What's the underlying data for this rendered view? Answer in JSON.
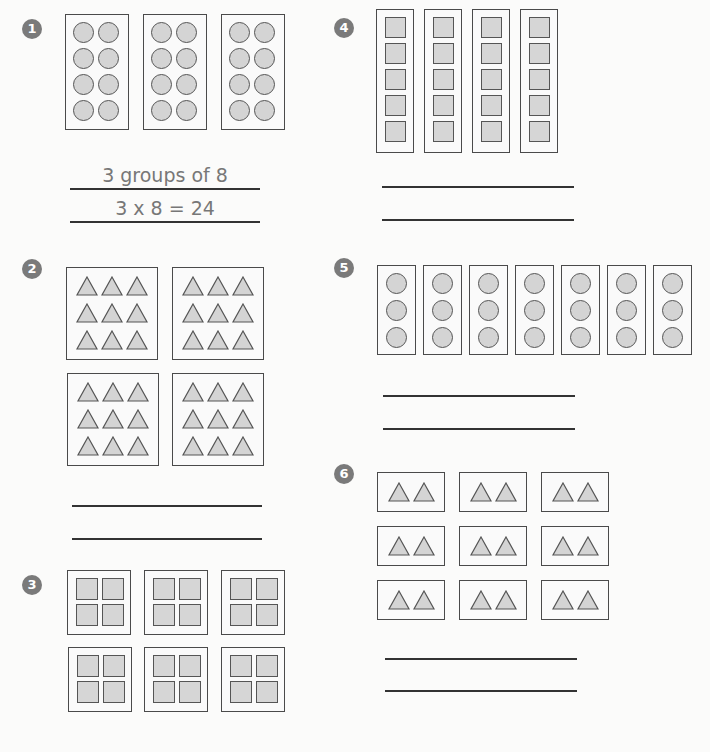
{
  "worksheet": {
    "problems": [
      {
        "number": "1",
        "groups": 3,
        "items_per_group": 8,
        "shape": "circle",
        "answer_line_1": "3 groups of 8",
        "answer_line_2": "3 x 8 = 24"
      },
      {
        "number": "2",
        "groups": 4,
        "items_per_group": 9,
        "shape": "triangle",
        "answer_line_1": "",
        "answer_line_2": ""
      },
      {
        "number": "3",
        "groups": 6,
        "items_per_group": 4,
        "shape": "square",
        "answer_line_1": "",
        "answer_line_2": ""
      },
      {
        "number": "4",
        "groups": 4,
        "items_per_group": 5,
        "shape": "square",
        "answer_line_1": "",
        "answer_line_2": ""
      },
      {
        "number": "5",
        "groups": 7,
        "items_per_group": 3,
        "shape": "circle",
        "answer_line_1": "",
        "answer_line_2": ""
      },
      {
        "number": "6",
        "groups": 9,
        "items_per_group": 2,
        "shape": "triangle",
        "answer_line_1": "",
        "answer_line_2": ""
      }
    ]
  },
  "colors": {
    "badge": "#7a7a7a",
    "shape_fill": "#d4d4d4",
    "outline": "#4a4a4a",
    "answer_text": "#777777"
  }
}
